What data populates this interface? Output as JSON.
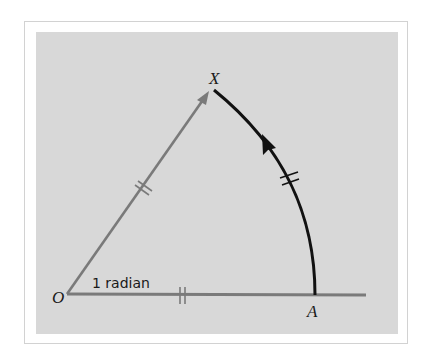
{
  "diagram": {
    "labels": {
      "origin": "O",
      "point_x": "X",
      "point_a": "A",
      "angle": "1 radian"
    },
    "colors": {
      "background_panel": "#d8d8d8",
      "radius_lines": "#7a7a7a",
      "arc": "#111111",
      "frame_border": "#d2d2d2"
    },
    "elements": [
      {
        "type": "ray",
        "from": "O",
        "to": "X",
        "arrow": true,
        "tick_marks": 2
      },
      {
        "type": "ray",
        "from": "O",
        "through": "A",
        "tick_marks": 2
      },
      {
        "type": "arc",
        "from": "A",
        "to": "X",
        "arrow_direction": "counterclockwise",
        "tick_marks": 2
      }
    ]
  }
}
